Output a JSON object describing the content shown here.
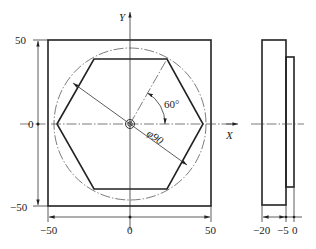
{
  "drawing": {
    "front_view": {
      "axis_x_label": "X",
      "axis_y_label": "Y",
      "angle_label": "60°",
      "diameter_label": "φ90",
      "y_dim_labels": {
        "top": "50",
        "middle": "0",
        "bottom": "−50"
      },
      "x_dim_labels": {
        "left": "−50",
        "middle": "0",
        "right": "50"
      },
      "square_half_width_units": 50,
      "circle_diameter_units": 90,
      "hexagon_sides": 6
    },
    "side_view": {
      "dim_labels": [
        "−20",
        "−5",
        "0"
      ],
      "z_values_units": [
        -20,
        -5,
        0
      ]
    }
  }
}
